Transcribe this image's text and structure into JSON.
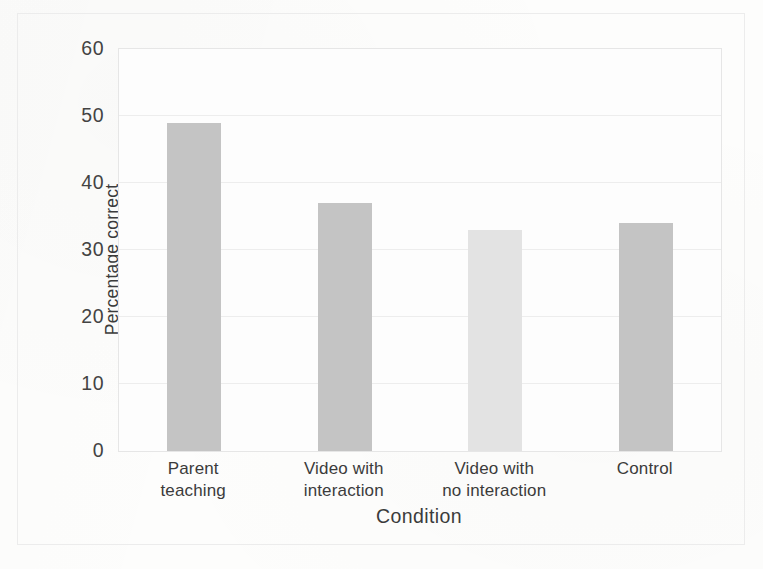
{
  "figure": {
    "background_color": "#fdfdfc",
    "frame_color": "#e6e6e6",
    "gridline_color": "#ededed"
  },
  "chart_data": {
    "type": "bar",
    "title": "",
    "subtitle": "",
    "xlabel": "Condition",
    "ylabel": "Percentage correct",
    "categories": [
      "Parent teaching",
      "Video with interaction",
      "Video with no interaction",
      "Control"
    ],
    "category_lines": [
      [
        "Parent",
        "teaching"
      ],
      [
        "Video with",
        "interaction"
      ],
      [
        "Video with",
        "no interaction"
      ],
      [
        "Control"
      ]
    ],
    "values": [
      49,
      37,
      33,
      34
    ],
    "bar_colors": [
      "#c4c4c4",
      "#c4c4c4",
      "#e3e3e3",
      "#c4c4c4"
    ],
    "ylim": [
      0,
      60
    ],
    "yticks": [
      0,
      10,
      20,
      30,
      40,
      50,
      60
    ],
    "ytick_labels": [
      "0",
      "10",
      "20",
      "30",
      "40",
      "50",
      "60"
    ],
    "grid": true,
    "grid_axis": "y",
    "legend": false,
    "legend_position": "none",
    "annotations": []
  }
}
